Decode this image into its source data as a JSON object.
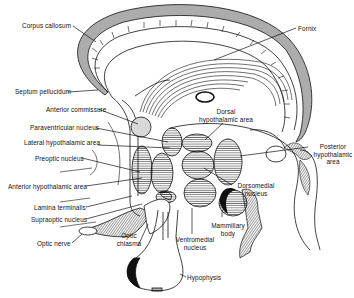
{
  "diagram": {
    "colors": {
      "line": "#111111",
      "background": "#ffffff",
      "shade": "#d8d8d8"
    },
    "labels": [
      {
        "id": "corpus-callosum",
        "text": "Corpus callosum"
      },
      {
        "id": "fornix",
        "text": "Fornix"
      },
      {
        "id": "septum-pellucidum",
        "text": "Septum pellucidum"
      },
      {
        "id": "anterior-commissure",
        "text": "Anterior commissure"
      },
      {
        "id": "paraventricular-nucleus",
        "text": "Paraventricular nucleus"
      },
      {
        "id": "lateral-hypothalamic-area",
        "text": "Lateral hypothalamic area"
      },
      {
        "id": "dorsal-hypothalamic-area",
        "text": "Dorsal hypothalamic area"
      },
      {
        "id": "posterior-hypothalamic-area",
        "text": "Posterior hypothalamic area"
      },
      {
        "id": "preoptic-nucleus",
        "text": "Preoptic nucleus"
      },
      {
        "id": "anterior-hypothalamic-area",
        "text": "Anterior hypothalamic area"
      },
      {
        "id": "lamina-terminalis",
        "text": "Lamina terminalis"
      },
      {
        "id": "supraoptic-nucleus",
        "text": "Supraoptic nucleus"
      },
      {
        "id": "optic-nerve",
        "text": "Optic nerve"
      },
      {
        "id": "optic-chiasma",
        "text": "Optic chiasma"
      },
      {
        "id": "dorsomedial-nucleus",
        "text": "Dorsomedial nucleus"
      },
      {
        "id": "mammillary-body",
        "text": "Mammillary body"
      },
      {
        "id": "ventromedial-nucleus",
        "text": "Ventromedial nucleus"
      },
      {
        "id": "hypophysis",
        "text": "Hypophysis"
      }
    ],
    "multiline": {
      "dorsal": [
        "Dorsal",
        "hypothalamic area"
      ],
      "posterior": [
        "Posterior",
        "hypothalamic",
        "area"
      ],
      "optic_chiasma": [
        "Optic",
        "chiasma"
      ],
      "dorsomedial": [
        "Dorsomedial",
        "nucleus"
      ],
      "mammillary": [
        "Mammillary",
        "body"
      ],
      "ventromedial": [
        "Ventromedial",
        "nucleus"
      ]
    }
  }
}
